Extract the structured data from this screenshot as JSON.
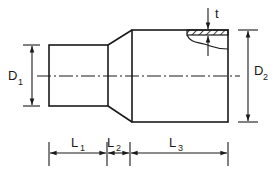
{
  "diagram": {
    "type": "technical-drawing",
    "stroke_color": "#1a1a1a",
    "background": "#ffffff",
    "labels": {
      "D1": {
        "main": "D",
        "sub": "1"
      },
      "D2": {
        "main": "D",
        "sub": "2"
      },
      "L1": {
        "main": "L",
        "sub": "1"
      },
      "L2": {
        "main": "L",
        "sub": "2"
      },
      "L3": {
        "main": "L",
        "sub": "3"
      },
      "t": {
        "main": "t"
      }
    },
    "parts": [
      {
        "name": "small-cylinder",
        "dimension_diameter": "D1",
        "dimension_length": "L1"
      },
      {
        "name": "taper-section",
        "dimension_length": "L2"
      },
      {
        "name": "large-cylinder",
        "dimension_diameter": "D2",
        "dimension_length": "L3",
        "wall_thickness": "t"
      }
    ]
  }
}
